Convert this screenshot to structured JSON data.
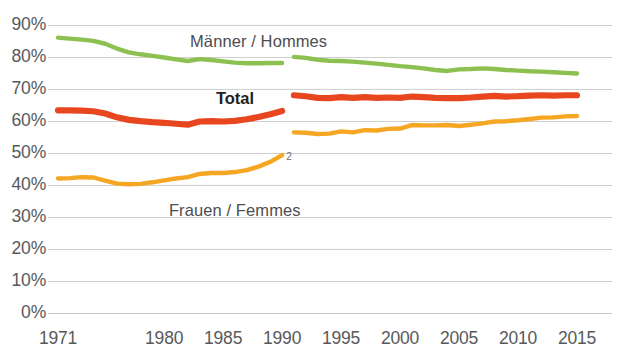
{
  "chart_data": {
    "type": "line",
    "title": "",
    "subtitle": "",
    "xlabel": "",
    "ylabel": "",
    "xlim": [
      1971,
      2015
    ],
    "ylim": [
      0,
      90
    ],
    "grid": true,
    "legend_position": "inline-annotations",
    "x_ticks": [
      "1971",
      "1980",
      "1985",
      "1990",
      "1995",
      "2000",
      "2005",
      "2010",
      "2015"
    ],
    "x_tick_values": [
      1971,
      1980,
      1985,
      1990,
      1995,
      2000,
      2005,
      2010,
      2015
    ],
    "y_ticks": [
      "0%",
      "10%",
      "20%",
      "30%",
      "40%",
      "50%",
      "60%",
      "70%",
      "80%",
      "90%"
    ],
    "y_tick_values": [
      0,
      10,
      20,
      30,
      40,
      50,
      60,
      70,
      80,
      90
    ],
    "series_break_note": "2",
    "series_break_between": [
      1990,
      1991
    ],
    "series": [
      {
        "name": "Männer / Hommes",
        "color": "#8CC152",
        "label_x": 1988,
        "label_y": 85,
        "segments": [
          {
            "x": [
              1971,
              1972,
              1973,
              1974,
              1975,
              1976,
              1977,
              1978,
              1979,
              1980,
              1981,
              1982,
              1983,
              1984,
              1985,
              1986,
              1987,
              1988,
              1989,
              1990
            ],
            "y": [
              86.2,
              85.9,
              85.6,
              85.2,
              84.3,
              82.8,
              81.6,
              81.0,
              80.5,
              80.0,
              79.4,
              78.9,
              79.5,
              79.2,
              78.8,
              78.4,
              78.2,
              78.2,
              78.3,
              78.3
            ]
          },
          {
            "x": [
              1991,
              1992,
              1993,
              1994,
              1995,
              1996,
              1997,
              1998,
              1999,
              2000,
              2001,
              2002,
              2003,
              2004,
              2005,
              2006,
              2007,
              2008,
              2009,
              2010,
              2011,
              2012,
              2013,
              2014,
              2015
            ],
            "y": [
              80.2,
              79.9,
              79.3,
              79.0,
              78.9,
              78.7,
              78.4,
              78.1,
              77.7,
              77.3,
              77.0,
              76.6,
              76.1,
              75.8,
              76.3,
              76.4,
              76.6,
              76.4,
              76.1,
              75.9,
              75.7,
              75.6,
              75.4,
              75.2,
              75.0
            ]
          }
        ]
      },
      {
        "name": "Total",
        "color": "#E8461E",
        "label_x": 1986,
        "label_y": 67,
        "segments": [
          {
            "x": [
              1971,
              1972,
              1973,
              1974,
              1975,
              1976,
              1977,
              1978,
              1979,
              1980,
              1981,
              1982,
              1983,
              1984,
              1985,
              1986,
              1987,
              1988,
              1989,
              1990
            ],
            "y": [
              63.5,
              63.5,
              63.4,
              63.2,
              62.5,
              61.3,
              60.5,
              60.1,
              59.8,
              59.6,
              59.3,
              59.0,
              60.0,
              60.1,
              60.0,
              60.2,
              60.7,
              61.4,
              62.3,
              63.3
            ]
          },
          {
            "x": [
              1991,
              1992,
              1993,
              1994,
              1995,
              1996,
              1997,
              1998,
              1999,
              2000,
              2001,
              2002,
              2003,
              2004,
              2005,
              2006,
              2007,
              2008,
              2009,
              2010,
              2011,
              2012,
              2013,
              2014,
              2015
            ],
            "y": [
              68.2,
              67.9,
              67.4,
              67.3,
              67.6,
              67.4,
              67.6,
              67.4,
              67.5,
              67.4,
              67.8,
              67.6,
              67.4,
              67.3,
              67.3,
              67.5,
              67.8,
              68.0,
              67.8,
              67.9,
              68.1,
              68.2,
              68.1,
              68.2,
              68.2
            ]
          }
        ]
      },
      {
        "name": "Frauen / Femmes",
        "color": "#F5A623",
        "label_x": 1986,
        "label_y": 32,
        "segments": [
          {
            "x": [
              1971,
              1972,
              1973,
              1974,
              1975,
              1976,
              1977,
              1978,
              1979,
              1980,
              1981,
              1982,
              1983,
              1984,
              1985,
              1986,
              1987,
              1988,
              1989,
              1990
            ],
            "y": [
              42.2,
              42.3,
              42.6,
              42.5,
              41.5,
              40.6,
              40.4,
              40.5,
              41.0,
              41.6,
              42.2,
              42.6,
              43.6,
              43.9,
              43.9,
              44.2,
              44.8,
              45.9,
              47.4,
              49.5
            ]
          },
          {
            "x": [
              1991,
              1992,
              1993,
              1994,
              1995,
              1996,
              1997,
              1998,
              1999,
              2000,
              2001,
              2002,
              2003,
              2004,
              2005,
              2006,
              2007,
              2008,
              2009,
              2010,
              2011,
              2012,
              2013,
              2014,
              2015
            ],
            "y": [
              56.6,
              56.5,
              56.1,
              56.2,
              56.9,
              56.6,
              57.3,
              57.2,
              57.7,
              57.8,
              58.9,
              58.8,
              58.8,
              58.9,
              58.6,
              59.0,
              59.4,
              60.0,
              60.1,
              60.4,
              60.8,
              61.2,
              61.3,
              61.6,
              61.7
            ]
          }
        ]
      }
    ]
  },
  "colors": {
    "green": "#8CC152",
    "orange_red": "#E8461E",
    "orange": "#F5A623",
    "gridline": "#c9cacc",
    "axis_text": "#58595b"
  }
}
